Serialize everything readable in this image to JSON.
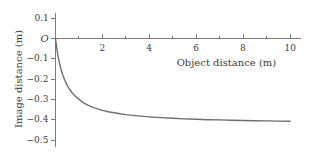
{
  "chart_data": {
    "type": "line",
    "title": "",
    "xlabel": "Object distance (m)",
    "ylabel": "Image distance (m)",
    "xlim": [
      0,
      10.4
    ],
    "ylim": [
      -0.55,
      0.13
    ],
    "grid": false,
    "legend": "none",
    "x_ticks_major": [
      2,
      4,
      6,
      8,
      10
    ],
    "x_tick_labels": [
      "2",
      "4",
      "6",
      "8",
      "10"
    ],
    "x_ticks_minor": [
      1,
      3,
      5,
      7,
      9
    ],
    "y_ticks_major": [
      0.1,
      0,
      -0.1,
      -0.2,
      -0.3,
      -0.4,
      -0.5
    ],
    "y_tick_labels": [
      "0.1",
      "O",
      "−0.1",
      "−0.2",
      "−0.3",
      "−0.4",
      "−0.5"
    ],
    "origin_label": "O",
    "series": [
      {
        "name": "image distance",
        "color": "#6e6e6e",
        "x": [
          0.0,
          0.05,
          0.1,
          0.15,
          0.2,
          0.25,
          0.3,
          0.4,
          0.5,
          0.6,
          0.7,
          0.8,
          0.9,
          1.0,
          1.2,
          1.4,
          1.6,
          1.8,
          2.0,
          2.25,
          2.5,
          2.75,
          3.0,
          3.5,
          4.0,
          4.5,
          5.0,
          5.5,
          6.0,
          6.5,
          7.0,
          7.5,
          8.0,
          8.5,
          9.0,
          9.5,
          10.0
        ],
        "y": [
          0.0,
          -0.045,
          -0.081,
          -0.111,
          -0.136,
          -0.158,
          -0.176,
          -0.207,
          -0.231,
          -0.25,
          -0.266,
          -0.279,
          -0.29,
          -0.3,
          -0.317,
          -0.329,
          -0.339,
          -0.347,
          -0.354,
          -0.361,
          -0.366,
          -0.371,
          -0.375,
          -0.381,
          -0.386,
          -0.39,
          -0.393,
          -0.396,
          -0.398,
          -0.4,
          -0.401,
          -0.403,
          -0.404,
          -0.405,
          -0.406,
          -0.407,
          -0.408
        ]
      }
    ],
    "axis_color": "#7a7a7a",
    "curve_color": "#6e6e6e"
  },
  "axes": {
    "x_title": "Object distance (m)",
    "y_title": "Image distance (m)"
  },
  "ticks": {
    "x": [
      {
        "label": "2",
        "value": 2
      },
      {
        "label": "4",
        "value": 4
      },
      {
        "label": "6",
        "value": 6
      },
      {
        "label": "8",
        "value": 8
      },
      {
        "label": "10",
        "value": 10
      }
    ],
    "y": [
      {
        "label": "0.1",
        "value": 0.1
      },
      {
        "label": "O",
        "value": 0
      },
      {
        "label": "−0.1",
        "value": -0.1
      },
      {
        "label": "−0.2",
        "value": -0.2
      },
      {
        "label": "−0.3",
        "value": -0.3
      },
      {
        "label": "−0.4",
        "value": -0.4
      },
      {
        "label": "−0.5",
        "value": -0.5
      }
    ]
  }
}
